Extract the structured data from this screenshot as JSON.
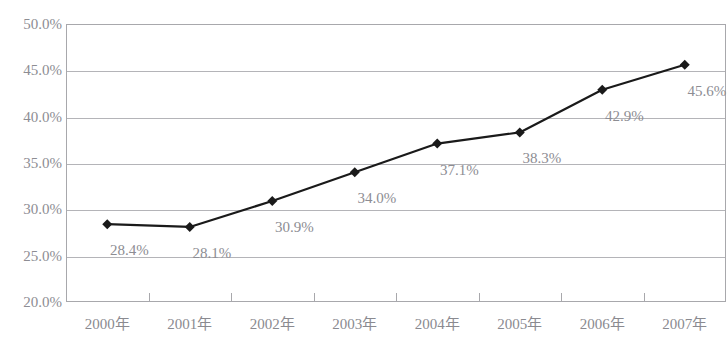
{
  "chart_data": {
    "type": "line",
    "title": "",
    "xlabel": "",
    "ylabel": "",
    "categories": [
      "2000年",
      "2001年",
      "2002年",
      "2003年",
      "2004年",
      "2005年",
      "2006年",
      "2007年"
    ],
    "values": [
      28.4,
      28.1,
      30.9,
      34.0,
      37.1,
      38.3,
      42.9,
      45.6
    ],
    "point_labels": [
      "28.4%",
      "28.1%",
      "30.9%",
      "34.0%",
      "37.1%",
      "38.3%",
      "42.9%",
      "45.6%"
    ],
    "ylim": [
      20.0,
      50.0
    ],
    "ytick_values": [
      50.0,
      45.0,
      40.0,
      35.0,
      30.0,
      25.0,
      20.0
    ],
    "ytick_labels": [
      "50.0%",
      "45.0%",
      "40.0%",
      "35.0%",
      "30.0%",
      "25.0%",
      "20.0%"
    ],
    "grid": true,
    "legend": false,
    "legend_position": "none",
    "marker": "diamond",
    "series_color": "#1a1a1a",
    "grid_color": "#b4b4b8",
    "axis_color": "#a8a8ac",
    "text_color": "#8d8d93"
  }
}
